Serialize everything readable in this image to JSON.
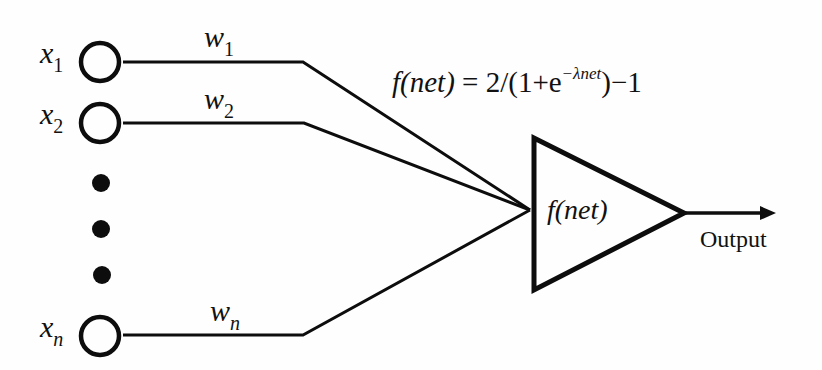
{
  "diagram": {
    "inputs": [
      {
        "symbol": "x",
        "subscript": "1",
        "weight_symbol": "w",
        "weight_subscript": "1"
      },
      {
        "symbol": "x",
        "subscript": "2",
        "weight_symbol": "w",
        "weight_subscript": "2"
      },
      {
        "symbol": "x",
        "subscript": "n",
        "weight_symbol": "w",
        "weight_subscript": "n"
      }
    ],
    "ellipsis_dots": 3,
    "formula": {
      "lhs": "f(net)",
      "eq": " = 2/(1+e",
      "exponent": "−λnet",
      "rhs": ")−1"
    },
    "neuron_label": "f(net)",
    "output_label": "Output",
    "colors": {
      "stroke": "#0d0d0d",
      "background": "#fefefe"
    }
  }
}
